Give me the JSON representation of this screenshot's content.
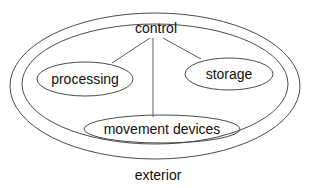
{
  "diagram": {
    "type": "nested-ellipse-venn",
    "title_label": "exterior",
    "stroke_color": "#4a4a4a",
    "text_color": "#101010",
    "background_color": "#ffffff",
    "nodes": [
      {
        "id": "control",
        "label": "control",
        "shape": "text-only",
        "cx": 156,
        "cy": 28
      },
      {
        "id": "processing",
        "label": "processing",
        "shape": "ellipse",
        "cx": 85,
        "cy": 79,
        "rx": 48,
        "ry": 17
      },
      {
        "id": "storage",
        "label": "storage",
        "shape": "ellipse",
        "cx": 229,
        "cy": 74,
        "rx": 44,
        "ry": 16
      },
      {
        "id": "movement-devices",
        "label": "movement devices",
        "shape": "ellipse",
        "cx": 162,
        "cy": 129,
        "rx": 78,
        "ry": 14
      },
      {
        "id": "interior",
        "label": "",
        "shape": "ellipse",
        "cx": 155,
        "cy": 84,
        "rx": 133,
        "ry": 60
      },
      {
        "id": "exterior",
        "label": "exterior",
        "shape": "ellipse",
        "cx": 155,
        "cy": 86,
        "rx": 145,
        "ry": 73
      }
    ],
    "connectors": [
      {
        "id": "control-to-processing",
        "from": "control",
        "to": "processing",
        "x1": 150,
        "y1": 38,
        "x2": 112,
        "y2": 63
      },
      {
        "id": "control-to-movement-devices",
        "from": "control",
        "to": "movement-devices",
        "x1": 153,
        "y1": 38,
        "x2": 153,
        "y2": 117
      },
      {
        "id": "control-to-storage",
        "from": "control",
        "to": "storage",
        "x1": 163,
        "y1": 38,
        "x2": 201,
        "y2": 59
      }
    ],
    "exterior_caption": {
      "label": "exterior",
      "cx": 158,
      "cy": 175
    }
  }
}
